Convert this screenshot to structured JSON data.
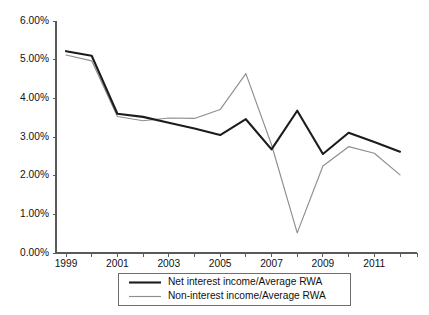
{
  "chart_data": {
    "type": "line",
    "title": "",
    "subtitle": "",
    "xlabel": "",
    "ylabel": "",
    "x": [
      1999,
      2000,
      2001,
      2002,
      2003,
      2004,
      2005,
      2006,
      2007,
      2008,
      2009,
      2010,
      2011,
      2012
    ],
    "xlim": [
      1999,
      2012
    ],
    "ylim": [
      0.0,
      6.0
    ],
    "ytick_values": [
      0.0,
      1.0,
      2.0,
      3.0,
      4.0,
      5.0,
      6.0
    ],
    "ytick_labels": [
      "0.00%",
      "1.00%",
      "2.00%",
      "3.00%",
      "4.00%",
      "5.00%",
      "6.00%"
    ],
    "xtick_values": [
      1999,
      2000,
      2001,
      2002,
      2003,
      2004,
      2005,
      2006,
      2007,
      2008,
      2009,
      2010,
      2011,
      2012
    ],
    "xtick_labels": [
      "1999",
      "",
      "2001",
      "",
      "2003",
      "",
      "2005",
      "",
      "2007",
      "",
      "2009",
      "",
      "2011",
      ""
    ],
    "grid": false,
    "legend_position": "below-center",
    "series": [
      {
        "name": "Net interest income/Average RWA",
        "color": "#1c1c1c",
        "style": "thick-solid",
        "values": [
          5.22,
          5.1,
          3.6,
          3.52,
          3.37,
          3.22,
          3.05,
          3.46,
          2.68,
          3.68,
          2.56,
          3.11,
          2.87,
          2.62
        ]
      },
      {
        "name": "Non-interest income/Average RWA",
        "color": "#8e8e8e",
        "style": "thin-solid",
        "values": [
          5.12,
          4.97,
          3.53,
          3.42,
          3.49,
          3.48,
          3.71,
          4.64,
          2.8,
          0.52,
          2.25,
          2.75,
          2.58,
          2.02
        ]
      }
    ]
  },
  "legend": {
    "entries": [
      {
        "label": "Net interest income/Average RWA"
      },
      {
        "label": "Non-interest income/Average RWA"
      }
    ]
  }
}
